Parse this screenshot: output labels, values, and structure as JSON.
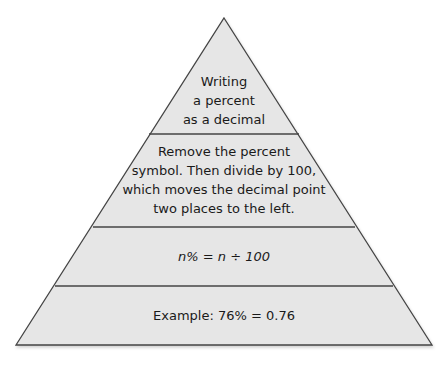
{
  "diagram": {
    "type": "pyramid",
    "fill_color": "#e6e6e6",
    "stroke_color": "#444444",
    "levels": [
      {
        "lines": [
          "Writing",
          "a percent",
          "as a decimal"
        ]
      },
      {
        "lines": [
          "Remove the percent",
          "symbol. Then divide by 100,",
          "which moves the decimal point",
          "two places to the left."
        ]
      },
      {
        "lines": [
          "n% = n ÷ 100"
        ]
      },
      {
        "lines": [
          "Example:  76% = 0.76"
        ]
      }
    ]
  }
}
